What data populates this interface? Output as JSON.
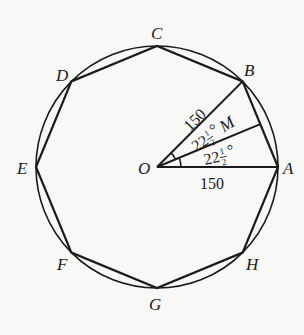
{
  "diagram": {
    "type": "regular-octagon-inscribed-in-circle",
    "center_label": "O",
    "vertex_labels": [
      "A",
      "B",
      "C",
      "D",
      "E",
      "F",
      "G",
      "H"
    ],
    "midpoint_label": "M",
    "radius_label_OB": "150",
    "radius_label_OA": "150",
    "angle_BOM": {
      "whole": "22",
      "numerator": "1",
      "denominator": "2",
      "unit": "°"
    },
    "angle_MOA": {
      "whole": "22",
      "numerator": "1",
      "denominator": "2",
      "unit": "°"
    },
    "stroke_color": "#1a1a1a",
    "background_color": "#f8f8f6"
  }
}
